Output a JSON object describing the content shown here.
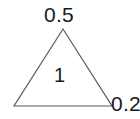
{
  "figure": {
    "type": "triangle-diagram",
    "background_color": "#ffffff",
    "stroke_color": "#595959",
    "text_color": "#1a1a1a",
    "labels": {
      "apex": "0.5",
      "bottom_right": "0.2",
      "interior": "1"
    },
    "geometry": {
      "apex": {
        "x": 63,
        "y": 29
      },
      "bottom_left": {
        "x": 14,
        "y": 106
      },
      "bottom_right": {
        "x": 112,
        "y": 106
      },
      "stroke_width": 1.2
    }
  }
}
